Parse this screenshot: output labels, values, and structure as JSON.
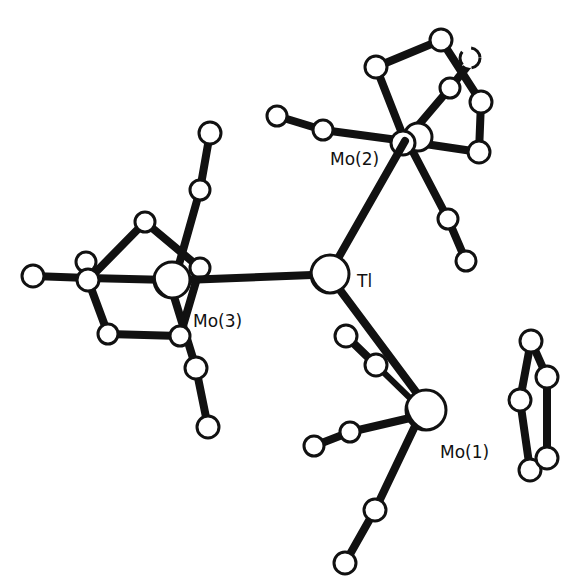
{
  "figure": {
    "type": "molecular-structure",
    "labels": {
      "mo2": "Mo(2)",
      "tl": "Tl",
      "mo3": "Mo(3)",
      "mo1": "Mo(1)"
    }
  },
  "atoms": {
    "tl": {
      "x": 330,
      "y": 274,
      "r": 19
    },
    "mo1": {
      "x": 426,
      "y": 410,
      "r": 20
    },
    "mo2": {
      "x": 405,
      "y": 141,
      "r": 14
    },
    "mo3": {
      "x": 170,
      "y": 280,
      "r": 18
    }
  }
}
